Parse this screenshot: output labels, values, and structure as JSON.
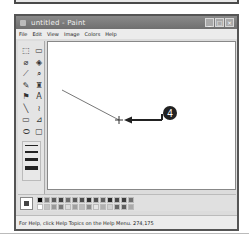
{
  "window": {
    "title": "untitled - Paint",
    "buttons": {
      "minimize": "_",
      "maximize": "□",
      "close": "×"
    }
  },
  "menubar": {
    "items": [
      "File",
      "Edit",
      "View",
      "Image",
      "Colors",
      "Help"
    ]
  },
  "toolbox": {
    "tools": [
      {
        "name": "free-form-select-icon",
        "glyph": "⬚"
      },
      {
        "name": "select-icon",
        "glyph": "▭"
      },
      {
        "name": "eraser-icon",
        "glyph": "⌀"
      },
      {
        "name": "fill-icon",
        "glyph": "◈"
      },
      {
        "name": "pick-color-icon",
        "glyph": "⟋"
      },
      {
        "name": "magnifier-icon",
        "glyph": "⌕"
      },
      {
        "name": "pencil-icon",
        "glyph": "✎"
      },
      {
        "name": "brush-icon",
        "glyph": "♜"
      },
      {
        "name": "airbrush-icon",
        "glyph": "⚑"
      },
      {
        "name": "text-icon",
        "glyph": "A"
      },
      {
        "name": "line-icon",
        "glyph": "╲"
      },
      {
        "name": "curve-icon",
        "glyph": "≀"
      },
      {
        "name": "rectangle-icon",
        "glyph": "▭"
      },
      {
        "name": "polygon-icon",
        "glyph": "⊿"
      },
      {
        "name": "ellipse-icon",
        "glyph": "⬭"
      },
      {
        "name": "rounded-rectangle-icon",
        "glyph": "▢"
      }
    ],
    "line_widths": [
      1,
      2,
      3,
      4
    ]
  },
  "canvas": {
    "line": {
      "x1": 14,
      "y1": 48,
      "x2": 71,
      "y2": 78,
      "color": "#777777"
    },
    "cursor": {
      "x": 71,
      "y": 78
    },
    "callout": {
      "number": "4",
      "color": "#222222"
    }
  },
  "palette": {
    "foreground": "#444444",
    "background": "#ffffff",
    "colors_row1": [
      "#000000",
      "#808080",
      "#5a5a5a",
      "#404040",
      "#6e6e6e",
      "#585858",
      "#4e4e4e",
      "#303030",
      "#505050",
      "#606060",
      "#2a2a2a",
      "#484848",
      "#3c3c3c",
      "#707070"
    ],
    "colors_row2": [
      "#ffffff",
      "#c0c0c0",
      "#999999",
      "#7a7a7a",
      "#dcdcdc",
      "#a0a0a0",
      "#bcbcbc",
      "#8e8e8e",
      "#e4e4e4",
      "#b0b0b0",
      "#d0d0d0",
      "#666666",
      "#5e5e5e",
      "#aaaaaa"
    ]
  },
  "statusbar": {
    "text": "For Help, click Help Topics on the Help Menu. 274,175"
  }
}
